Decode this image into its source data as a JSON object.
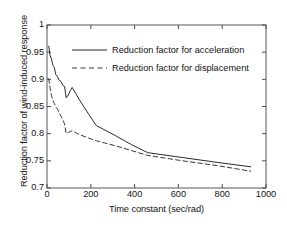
{
  "chart_data": {
    "type": "line",
    "title": "",
    "xlabel": "Time constant (sec/rad)",
    "ylabel": "Reduction factor of wind-induced response",
    "xlim": [
      0,
      1000
    ],
    "ylim": [
      0.7,
      1
    ],
    "xticks": [
      0,
      200,
      400,
      600,
      800,
      1000
    ],
    "yticks": [
      0.7,
      0.75,
      0.8,
      0.85,
      0.9,
      0.95,
      1
    ],
    "xticklabels": [
      "0",
      "200",
      "400",
      "600",
      "800",
      "1000"
    ],
    "yticklabels": [
      "0.7",
      "0.75",
      "0.8",
      "0.85",
      "0.9",
      "0.95",
      "1"
    ],
    "grid": false,
    "legend_position": "upper right inside",
    "series": [
      {
        "name": "Reduction factor for acceleration",
        "style": "solid",
        "color": "#2b2b2b",
        "x": [
          8,
          14,
          20,
          26,
          33,
          40,
          48,
          56,
          64,
          72,
          80,
          88,
          97,
          106,
          115,
          150,
          190,
          225,
          310,
          385,
          460,
          620,
          780,
          930
        ],
        "y": [
          0.961,
          0.944,
          0.938,
          0.927,
          0.922,
          0.909,
          0.905,
          0.898,
          0.896,
          0.889,
          0.887,
          0.866,
          0.871,
          0.879,
          0.885,
          0.861,
          0.836,
          0.815,
          0.797,
          0.78,
          0.765,
          0.756,
          0.747,
          0.739
        ]
      },
      {
        "name": "Reduction factor for displacement",
        "style": "dashed",
        "color": "#3a3a3a",
        "x": [
          8,
          14,
          20,
          26,
          33,
          40,
          48,
          56,
          64,
          72,
          80,
          88,
          97,
          106,
          115,
          150,
          190,
          225,
          310,
          385,
          460,
          620,
          780,
          930
        ],
        "y": [
          0.901,
          0.884,
          0.871,
          0.862,
          0.856,
          0.849,
          0.845,
          0.838,
          0.832,
          0.826,
          0.818,
          0.8,
          0.802,
          0.804,
          0.805,
          0.798,
          0.792,
          0.787,
          0.778,
          0.769,
          0.76,
          0.75,
          0.741,
          0.731
        ]
      }
    ]
  },
  "legend": {
    "entries": [
      {
        "label": "Reduction factor for acceleration",
        "style": "solid"
      },
      {
        "label": "Reduction factor for displacement",
        "style": "dashed"
      }
    ]
  },
  "axes": {
    "x_title": "Time constant (sec/rad)",
    "y_title": "Reduction factor of wind-induced response",
    "x_tick_0": "0",
    "x_tick_1": "200",
    "x_tick_2": "400",
    "x_tick_3": "600",
    "x_tick_4": "800",
    "x_tick_5": "1000",
    "y_tick_0": "0.7",
    "y_tick_1": "0.75",
    "y_tick_2": "0.8",
    "y_tick_3": "0.85",
    "y_tick_4": "0.9",
    "y_tick_5": "0.95",
    "y_tick_6": "1"
  },
  "style": {
    "axis_color": "#4d4d4d",
    "text_color": "#121212",
    "background": "#ffffff"
  }
}
